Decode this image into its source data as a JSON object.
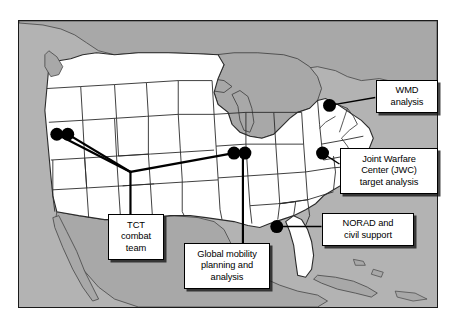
{
  "figure": {
    "name": "united-states-map-with-mission-callouts",
    "frame": {
      "border_color": "#1a1a1a",
      "ocean_color": "#b3b3b3",
      "foreign_land_color": "#a8a8a8",
      "us_land_color": "#ffffff",
      "state_border_color": "#333333"
    }
  },
  "callouts": [
    {
      "id": "wmd",
      "label": "WMD\nanalysis",
      "lines": [
        "WMD",
        "analysis"
      ],
      "anchor": {
        "x": 330,
        "y": 105
      }
    },
    {
      "id": "jwc",
      "label": "Joint Warfare\nCenter (JWC)\ntarget analysis",
      "lines": [
        "Joint Warfare",
        "Center (JWC)",
        "target analysis"
      ],
      "anchor": {
        "x": 323,
        "y": 153
      }
    },
    {
      "id": "norad",
      "label": "NORAD and\ncivil support",
      "lines": [
        "NORAD and",
        "civil support"
      ],
      "anchor": {
        "x": 277,
        "y": 227
      }
    },
    {
      "id": "gmpa",
      "label": "Global mobility\nplanning and\nanalysis",
      "lines": [
        "Global mobility",
        "planning and",
        "analysis"
      ],
      "anchor": {
        "x": 243,
        "y": 153
      }
    },
    {
      "id": "tct",
      "label": "TCT\ncombat\nteam",
      "lines": [
        "TCT",
        "combat",
        "team"
      ],
      "anchor": {
        "x": 130,
        "y": 172
      }
    }
  ],
  "site_markers": [
    {
      "id": "site-west-1",
      "x": 56,
      "y": 134,
      "r": 6.5
    },
    {
      "id": "site-west-2",
      "x": 67,
      "y": 134,
      "r": 6.5
    },
    {
      "id": "site-mid-1",
      "x": 234,
      "y": 153,
      "r": 6.5
    },
    {
      "id": "site-mid-2",
      "x": 245,
      "y": 153,
      "r": 6.5
    },
    {
      "id": "site-wmd",
      "x": 330,
      "y": 105,
      "r": 6.5
    },
    {
      "id": "site-jwc",
      "x": 323,
      "y": 153,
      "r": 6.5
    },
    {
      "id": "site-norad",
      "x": 277,
      "y": 227,
      "r": 6.5
    }
  ],
  "connector_paths": [
    {
      "id": "link-west1-vertex",
      "points": "56,134 130,172"
    },
    {
      "id": "link-west2-vertex",
      "points": "67,134 130,172"
    },
    {
      "id": "link-vertex-mid",
      "points": "130,172 234,153"
    },
    {
      "id": "link-vertex-down",
      "points": "130,172 130,214"
    },
    {
      "id": "link-mid-down",
      "points": "243,153 243,243"
    },
    {
      "id": "link-wmd-box",
      "points": "330,105 376,96"
    },
    {
      "id": "link-jwc-box",
      "points": "323,153 340,163"
    },
    {
      "id": "link-norad-box",
      "points": "277,227 322,227"
    }
  ]
}
